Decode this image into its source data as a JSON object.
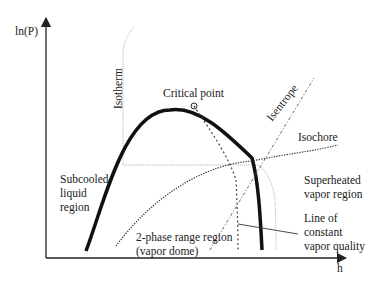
{
  "diagram": {
    "type": "pressure-enthalpy (ln P - h) phase diagram",
    "axes": {
      "y_label": "ln(P)",
      "x_label": "h"
    },
    "labels": {
      "critical_point": "Critical point",
      "isotherm": "Isotherm",
      "isentrope": "Isentrope",
      "isochore": "Isochore",
      "subcooled": [
        "Subcooled",
        "liquid",
        "region"
      ],
      "superheated": [
        "Superheated",
        "vapor region"
      ],
      "constant_quality": [
        "Line of",
        "constant",
        "vapor quality"
      ],
      "two_phase": [
        "2-phase range region",
        "(vapor dome)"
      ]
    },
    "colors": {
      "axis": "#222222",
      "dome": "#111111",
      "isotherm": "#b5b5b5",
      "dashed_lines": "#555555",
      "text": "#1a1a1a"
    }
  }
}
